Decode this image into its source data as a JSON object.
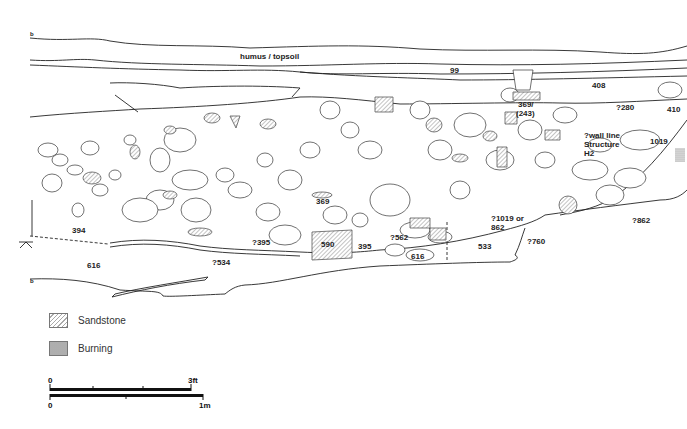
{
  "section": {
    "corner_labels": {
      "top_left": "b",
      "bottom_left": "b"
    },
    "layers": {
      "topsoil": "humus / topsoil"
    },
    "context_labels": [
      {
        "id": "c99",
        "text": "99",
        "x": 450,
        "y": 69
      },
      {
        "id": "c408",
        "text": "408",
        "x": 592,
        "y": 84
      },
      {
        "id": "c369a",
        "text": "369/",
        "x": 518,
        "y": 103
      },
      {
        "id": "c243",
        "text": "(243)",
        "x": 516,
        "y": 112
      },
      {
        "id": "c280",
        "text": "?280",
        "x": 616,
        "y": 106
      },
      {
        "id": "c410",
        "text": "410",
        "x": 667,
        "y": 108
      },
      {
        "id": "c1019",
        "text": "1019",
        "x": 650,
        "y": 140
      },
      {
        "id": "c369b",
        "text": "369",
        "x": 316,
        "y": 200
      },
      {
        "id": "c394",
        "text": "394",
        "x": 72,
        "y": 229
      },
      {
        "id": "c1019or",
        "text": "?1019 or",
        "x": 491,
        "y": 217
      },
      {
        "id": "c862a",
        "text": "862",
        "x": 491,
        "y": 226
      },
      {
        "id": "c862b",
        "text": "?862",
        "x": 632,
        "y": 219
      },
      {
        "id": "c395q",
        "text": "?395",
        "x": 252,
        "y": 241
      },
      {
        "id": "c590",
        "text": "590",
        "x": 321,
        "y": 241
      },
      {
        "id": "c395",
        "text": "395",
        "x": 358,
        "y": 245
      },
      {
        "id": "c562",
        "text": "?562",
        "x": 390,
        "y": 236
      },
      {
        "id": "c760",
        "text": "?760",
        "x": 527,
        "y": 240
      },
      {
        "id": "c533",
        "text": "533",
        "x": 478,
        "y": 245
      },
      {
        "id": "c616a",
        "text": "616",
        "x": 87,
        "y": 264
      },
      {
        "id": "c616b",
        "text": "616",
        "x": 411,
        "y": 254
      },
      {
        "id": "c534",
        "text": "?534",
        "x": 212,
        "y": 261
      }
    ],
    "annotation": {
      "line1": "?wall line",
      "line2": "Structure",
      "line3": "H2"
    }
  },
  "legend": {
    "items": [
      {
        "key": "sandstone",
        "label": "Sandstone"
      },
      {
        "key": "burning",
        "label": "Burning"
      }
    ]
  },
  "scale_bar": {
    "imperial": {
      "start": "0",
      "end": "3ft"
    },
    "metric": {
      "start": "0",
      "end": "1m"
    }
  },
  "colors": {
    "line": "#222222",
    "hatch": "#999999",
    "background": "#ffffff"
  }
}
